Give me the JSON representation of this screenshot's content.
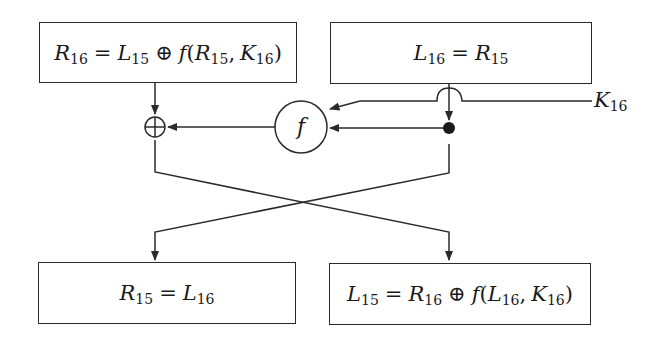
{
  "boxes": {
    "top_left": {
      "lhs_var": "R",
      "lhs_sub": "16",
      "rhs": [
        {
          "var": "L",
          "sub": "15"
        },
        {
          "op": "⊕"
        },
        {
          "var": "f",
          "open": "("
        },
        {
          "var": "R",
          "sub": "15",
          "sep": ", "
        },
        {
          "var": "K",
          "sub": "16",
          "close": ")"
        }
      ],
      "text": "R16 = L15 ⊕ f(R15, K16)"
    },
    "top_right": {
      "lhs_var": "L",
      "lhs_sub": "16",
      "rhs_var": "R",
      "rhs_sub": "15",
      "text": "L16 = R15"
    },
    "bottom_left": {
      "lhs_var": "R",
      "lhs_sub": "15",
      "rhs_var": "L",
      "rhs_sub": "16",
      "text": "R15 = L16"
    },
    "bottom_right": {
      "text": "L15 = R16 ⊕ f(L16, K16)"
    }
  },
  "nodes": {
    "xor_symbol": "⊕",
    "function_label": "f",
    "key_label_var": "K",
    "key_label_sub": "16"
  },
  "symbols": {
    "equals": "=",
    "xor": "⊕",
    "open_paren": "(",
    "close_paren": ")",
    "comma": ","
  },
  "colors": {
    "stroke": "#2a2a2a",
    "background": "#ffffff"
  }
}
